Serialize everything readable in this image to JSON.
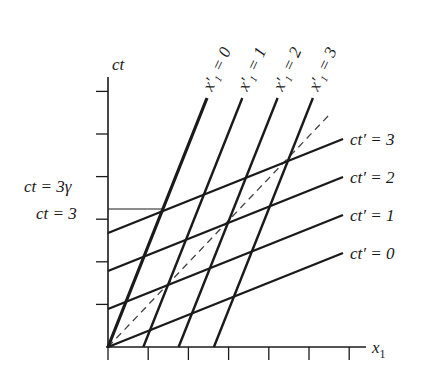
{
  "diagram": {
    "type": "spacetime-diagram",
    "axes": {
      "vertical_label": "ct",
      "horizontal_label": "x",
      "horizontal_label_subscript": "1",
      "tick_count_vertical": 6,
      "tick_count_horizontal": 6
    },
    "left_labels": [
      {
        "text": "ct = 3γ"
      },
      {
        "text": "ct = 3"
      }
    ],
    "primed_time_lines": [
      {
        "label": "ct′ = 3",
        "value": 3
      },
      {
        "label": "ct′ = 2",
        "value": 2
      },
      {
        "label": "ct′ = 1",
        "value": 1
      },
      {
        "label": "ct′ = 0",
        "value": 0
      }
    ],
    "primed_space_lines": [
      {
        "label": "x′₁ = 0",
        "value": 0
      },
      {
        "label": "x′₁ = 1",
        "value": 1
      },
      {
        "label": "x′₁ = 2",
        "value": 2
      },
      {
        "label": "x′₁ = 3",
        "value": 3
      }
    ],
    "light_line": "dashed",
    "colors": {
      "ink": "#1a1a1a",
      "dash": "#444444",
      "background": "#ffffff"
    }
  }
}
